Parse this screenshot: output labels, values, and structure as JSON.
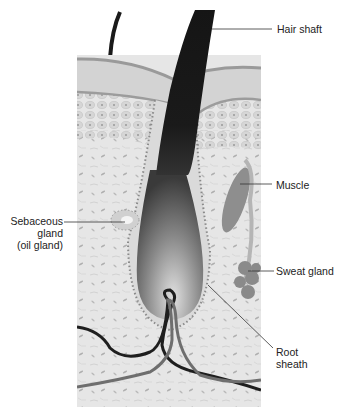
{
  "diagram": {
    "labels": {
      "hair_shaft": "Hair shaft",
      "muscle": "Muscle",
      "sebaceous_1": "Sebaceous",
      "sebaceous_2": "gland",
      "sebaceous_3": "(oil gland)",
      "sweat_gland": "Sweat gland",
      "root_1": "Root",
      "root_2": "sheath"
    },
    "colors": {
      "background": "#ffffff",
      "tissue": "#e4e4e4",
      "epidermis": "#d2d2d2",
      "surface": "#9a9a9a",
      "hair": "#1a1a1a",
      "bulb_light": "#d8d8d8",
      "bulb_dark": "#555555",
      "muscle": "#8e8e8e",
      "sweat_gland": "#8a8a8a",
      "vessel_dark": "#1e1e1e",
      "vessel_gray": "#6e6e6e",
      "leader_line": "#333333"
    }
  }
}
